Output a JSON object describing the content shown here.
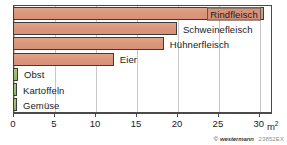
{
  "chart_data": {
    "type": "bar",
    "orientation": "horizontal",
    "title": "",
    "xlabel": "m²",
    "ylabel": "",
    "xlim": [
      0,
      31.6
    ],
    "grid": true,
    "xticks": [
      0,
      5,
      10,
      15,
      20,
      25,
      30
    ],
    "xtick_labels": [
      "0",
      "5",
      "10",
      "15",
      "20",
      "25",
      "30"
    ],
    "unit_label": "m",
    "unit_exponent": "2",
    "legend": "none",
    "categories": [
      "Rindfleisch",
      "Schweinefleisch",
      "Hühnerfleisch",
      "Eier",
      "Obst",
      "Kartoffeln",
      "Gemüse"
    ],
    "values": [
      30.6,
      20.0,
      18.4,
      12.3,
      0.6,
      0.4,
      0.3
    ],
    "bars": [
      {
        "label": "Rindfleisch",
        "value": 30.6,
        "group": "meat",
        "label_position": "inside"
      },
      {
        "label": "Schweinefleisch",
        "value": 20.0,
        "group": "meat",
        "label_position": "outside"
      },
      {
        "label": "Hühnerfleisch",
        "value": 18.4,
        "group": "meat",
        "label_position": "outside"
      },
      {
        "label": "Eier",
        "value": 12.3,
        "group": "meat",
        "label_position": "outside"
      },
      {
        "label": "Obst",
        "value": 0.6,
        "group": "plant",
        "label_position": "outside"
      },
      {
        "label": "Kartoffeln",
        "value": 0.4,
        "group": "plant",
        "label_position": "outside"
      },
      {
        "label": "Gemüse",
        "value": 0.3,
        "group": "plant",
        "label_position": "outside"
      }
    ],
    "colors": {
      "meat_bar": "#dd9b7e",
      "plant_bar": "#9cbc6e",
      "bar_border": "#3c3c3c",
      "grid": "#c9c9c9",
      "axis": "#4a4a4a",
      "text": "#1a1a1a",
      "highlight_label_bg": "#d79278"
    }
  },
  "credit": {
    "symbol": "©",
    "brand": "westermann",
    "code": "23852EX"
  }
}
